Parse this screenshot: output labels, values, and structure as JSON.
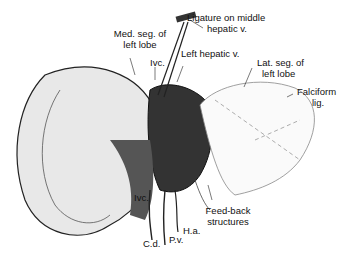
{
  "figure": {
    "labels": {
      "ligature_line1": "Ligature on middle",
      "ligature_line2": "hepatic v.",
      "med_seg_line1": "Med. seg. of",
      "med_seg_line2": "left lobe",
      "ivc_top": "Ivc.",
      "left_hepatic": "Left hepatic v.",
      "lat_seg_line1": "Lat. seg. of",
      "lat_seg_line2": "left lobe",
      "falciform_line1": "Falciform",
      "falciform_line2": "lig.",
      "ivc_bottom": "Ivc.",
      "feedback_line1": "Feed-back",
      "feedback_line2": "structures",
      "ha": "H.a.",
      "cd": "C.d.",
      "pv": "P.v."
    }
  }
}
